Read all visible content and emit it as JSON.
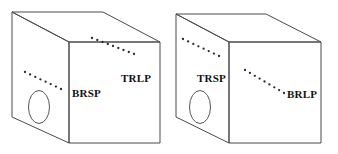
{
  "figure": {
    "title": "",
    "background_color": "#ffffff",
    "line_color": "#4a4a4a",
    "dot_color": "#2b2b2b",
    "label_color": "#111111"
  },
  "boxes": [
    {
      "id": "left-box",
      "name": "left-carton",
      "labels": [
        {
          "id": "brsp",
          "text": "BRSP",
          "x": 72,
          "y": 97
        },
        {
          "id": "trlp",
          "text": "TRLP",
          "x": 121,
          "y": 82
        }
      ],
      "hole": {
        "cx": 39,
        "cy": 107,
        "rx": 10.5,
        "ry": 16.5
      },
      "geometry": {
        "front": [
          [
            69,
            42
          ],
          [
            160,
            42
          ],
          [
            160,
            143
          ],
          [
            69,
            143
          ]
        ],
        "left": [
          [
            12,
            12
          ],
          [
            69,
            42
          ],
          [
            69,
            143
          ],
          [
            12,
            117
          ]
        ],
        "top": [
          [
            12,
            12
          ],
          [
            103,
            12
          ],
          [
            160,
            42
          ],
          [
            69,
            42
          ]
        ]
      },
      "dotted_lines": [
        {
          "id": "trlp-dots",
          "from": [
            92,
            38
          ],
          "to": [
            134,
            54
          ],
          "count": 9
        },
        {
          "id": "brsp-dots",
          "from": [
            25,
            72
          ],
          "to": [
            61,
            89
          ],
          "count": 8
        }
      ]
    },
    {
      "id": "right-box",
      "name": "right-carton",
      "labels": [
        {
          "id": "trsp",
          "text": "TRSP",
          "x": 197,
          "y": 82
        },
        {
          "id": "brlp",
          "text": "BRLP",
          "x": 287,
          "y": 98
        }
      ],
      "hole": {
        "cx": 200,
        "cy": 107,
        "rx": 10.5,
        "ry": 16.5
      },
      "geometry": {
        "front": [
          [
            229,
            42
          ],
          [
            321,
            42
          ],
          [
            321,
            143
          ],
          [
            229,
            143
          ]
        ],
        "left": [
          [
            176,
            14
          ],
          [
            229,
            42
          ],
          [
            229,
            143
          ],
          [
            176,
            117
          ]
        ],
        "top": [
          [
            176,
            14
          ],
          [
            266,
            14
          ],
          [
            321,
            42
          ],
          [
            229,
            42
          ]
        ]
      },
      "dotted_lines": [
        {
          "id": "trsp-dots",
          "from": [
            183,
            39
          ],
          "to": [
            219,
            56
          ],
          "count": 8
        },
        {
          "id": "brlp-dots",
          "from": [
            245,
            70
          ],
          "to": [
            284,
            93
          ],
          "count": 9
        }
      ]
    }
  ],
  "legend_terms": {
    "BRSP": "BRSP",
    "TRLP": "TRLP",
    "TRSP": "TRSP",
    "BRLP": "BRLP"
  }
}
